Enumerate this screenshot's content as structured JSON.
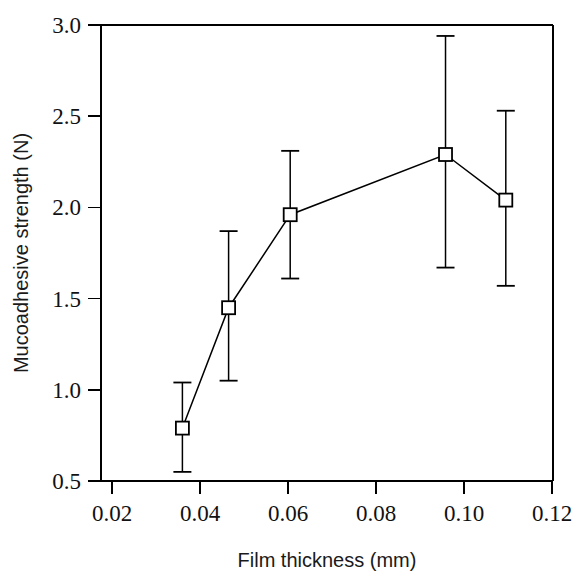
{
  "chart_data": {
    "type": "line",
    "title": "",
    "subtitle": "",
    "xlabel": "Film thickness (mm)",
    "ylabel": "Mucoadhesive strength (N)",
    "xlim": [
      0.02,
      0.12
    ],
    "ylim": [
      0.5,
      3.0
    ],
    "xticks": [
      0.02,
      0.04,
      0.06,
      0.08,
      0.1,
      0.12
    ],
    "xticklabels": [
      "0.02",
      "0.04",
      "0.06",
      "0.08",
      "0.10",
      "0.12"
    ],
    "yticks": [
      0.5,
      1.0,
      1.5,
      2.0,
      2.5,
      3.0
    ],
    "yticklabels": [
      "0.5",
      "1.0",
      "1.5",
      "2.0",
      "2.5",
      "3.0"
    ],
    "grid": false,
    "legend": false,
    "legend_position": "none",
    "marker": "open-square",
    "line_color": "#000000",
    "marker_facecolor": "#ffffff",
    "marker_edgecolor": "#000000",
    "errorbar_color": "#000000",
    "x": [
      0.036,
      0.0465,
      0.0605,
      0.0958,
      0.1095
    ],
    "y": [
      0.79,
      1.45,
      1.96,
      2.29,
      2.04
    ],
    "yerr_low": [
      0.55,
      1.05,
      1.61,
      1.67,
      1.57
    ],
    "yerr_high": [
      1.04,
      1.87,
      2.31,
      2.94,
      2.53
    ],
    "series": [
      {
        "name": "Mucoadhesive strength",
        "points": [
          {
            "x": 0.036,
            "y": 0.79,
            "low": 0.55,
            "high": 1.04
          },
          {
            "x": 0.0465,
            "y": 1.45,
            "low": 1.05,
            "high": 1.87
          },
          {
            "x": 0.0605,
            "y": 1.96,
            "low": 1.61,
            "high": 2.31
          },
          {
            "x": 0.0958,
            "y": 2.29,
            "low": 1.67,
            "high": 2.94
          },
          {
            "x": 0.1095,
            "y": 2.04,
            "low": 1.57,
            "high": 2.53
          }
        ]
      }
    ]
  }
}
